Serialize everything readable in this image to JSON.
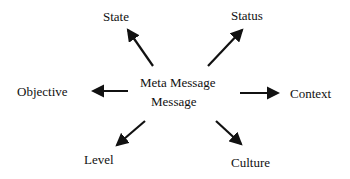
{
  "diagram": {
    "center": {
      "line1": "Meta Message",
      "line2": "Message"
    },
    "nodes": {
      "state": "State",
      "status": "Status",
      "objective": "Objective",
      "context": "Context",
      "level": "Level",
      "culture": "Culture"
    },
    "colors": {
      "arrow": "#111111",
      "text": "#111111",
      "background": "#ffffff"
    }
  }
}
